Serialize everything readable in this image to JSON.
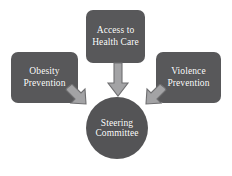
{
  "diagram": {
    "background_color": "#ffffff",
    "node_fill_color": "#58585a",
    "circle_fill_color": "#545456",
    "node_text_color": "#ffffff",
    "arrow_fill_color": "#a3a3a5",
    "arrow_stroke_color": "#6e6e70",
    "nodes": [
      {
        "id": "access-to-health-care",
        "label": "Access to\nHealth Care",
        "shape": "rounded-rectangle",
        "position": "top-center"
      },
      {
        "id": "obesity-prevention",
        "label": "Obesity\nPrevention",
        "shape": "rounded-rectangle",
        "position": "left"
      },
      {
        "id": "violence-prevention",
        "label": "Violence\nPrevention",
        "shape": "rounded-rectangle",
        "position": "right"
      },
      {
        "id": "steering-committee",
        "label": "Steering\nCommittee",
        "shape": "circle",
        "position": "bottom-center"
      }
    ],
    "arrows": [
      {
        "id": "arrow-access-to-steering",
        "direction": "down",
        "from": "access-to-health-care",
        "to": "steering-committee"
      },
      {
        "id": "arrow-obesity-to-steering",
        "direction": "down-right",
        "from": "obesity-prevention",
        "to": "steering-committee"
      },
      {
        "id": "arrow-violence-to-steering",
        "direction": "down-left",
        "from": "violence-prevention",
        "to": "steering-committee"
      }
    ]
  }
}
